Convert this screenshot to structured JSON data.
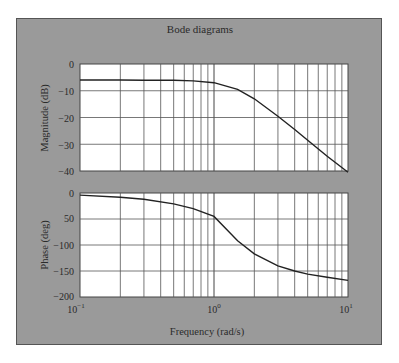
{
  "figure": {
    "title": "Bode diagrams",
    "xlabel": "Frequency (rad/s)",
    "colors": {
      "panel_bg": "#9a9a9a",
      "plot_bg": "#ffffff",
      "grid": "#444444",
      "curve": "#222222"
    }
  },
  "chart_data": [
    {
      "type": "line",
      "title": "Bode diagrams",
      "xlabel": "Frequency (rad/s)",
      "ylabel": "Magnitude (dB)",
      "xscale": "log",
      "xlim": [
        0.1,
        10
      ],
      "ylim": [
        -40,
        0
      ],
      "x_tick_labels": [
        "10^-1",
        "10^0",
        "10^1"
      ],
      "y_ticks": [
        0,
        -10,
        -20,
        -30,
        -40
      ],
      "grid": true,
      "series": [
        {
          "name": "Magnitude",
          "x": [
            0.1,
            0.2,
            0.3,
            0.5,
            0.7,
            1.0,
            1.5,
            2.0,
            3.0,
            4.0,
            5.0,
            7.0,
            10.0
          ],
          "values": [
            -6.0,
            -6.0,
            -6.1,
            -6.1,
            -6.3,
            -7.0,
            -9.5,
            -13.0,
            -19.5,
            -24.5,
            -28.5,
            -34.5,
            -40.5
          ]
        }
      ]
    },
    {
      "type": "line",
      "xlabel": "Frequency (rad/s)",
      "ylabel": "Phase (deg)",
      "xscale": "log",
      "xlim": [
        0.1,
        10
      ],
      "ylim": [
        -200,
        0
      ],
      "x_tick_labels": [
        "10^-1",
        "10^0",
        "10^1"
      ],
      "y_ticks": [
        0,
        50,
        -100,
        -150,
        -200
      ],
      "y_tick_labels": [
        "0",
        "50",
        "−100",
        "−150",
        "−200"
      ],
      "grid": true,
      "series": [
        {
          "name": "Phase",
          "x": [
            0.1,
            0.2,
            0.3,
            0.5,
            0.7,
            1.0,
            1.5,
            2.0,
            3.0,
            4.0,
            5.0,
            7.0,
            10.0
          ],
          "values": [
            -4,
            -8,
            -12,
            -21,
            -30,
            -45,
            -92,
            -117,
            -140,
            -150,
            -156,
            -162,
            -168
          ]
        }
      ]
    }
  ],
  "axes": {
    "mag": {
      "ylabel": "Magnitude (dB)",
      "ticks": [
        "0",
        "−10",
        "−20",
        "−30",
        "−40"
      ]
    },
    "phase": {
      "ylabel": "Phase (deg)",
      "ticks": [
        "0",
        "50",
        "−100",
        "−150",
        "−200"
      ]
    },
    "x_ticks": [
      {
        "base": "10",
        "exp": "−1"
      },
      {
        "base": "10",
        "exp": "0"
      },
      {
        "base": "10",
        "exp": "1"
      }
    ]
  }
}
